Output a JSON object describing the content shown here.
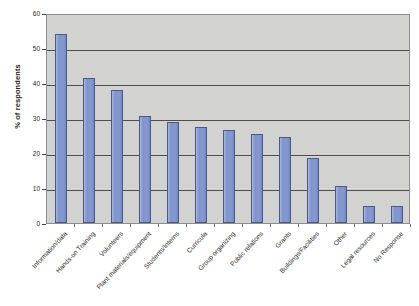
{
  "chart_data": {
    "type": "bar",
    "title": "",
    "xlabel": "",
    "ylabel": "% of respondents",
    "ylim": [
      0,
      60
    ],
    "ytick_step": 10,
    "yticks": [
      0,
      10,
      20,
      30,
      40,
      50,
      60
    ],
    "grid": "horizontal",
    "legend": "none",
    "plot_background": "#d2d2d0",
    "bar_color": "#8497d0",
    "bar_border_color": "#4a5a86",
    "categories": [
      "Information/data",
      "Hands-on Training",
      "Volunteers",
      "Plant materials/equipment",
      "Students/Interns",
      "Curricula",
      "Group organizing",
      "Public relations",
      "Grants",
      "Buildings/Facilities",
      "Other",
      "Legal resources",
      "No Response"
    ],
    "values": [
      54,
      41.5,
      38,
      30.5,
      29,
      27.5,
      26.5,
      25.5,
      24.5,
      18.5,
      10.5,
      5,
      5
    ]
  },
  "axis": {
    "y_title": "% of respondents"
  }
}
